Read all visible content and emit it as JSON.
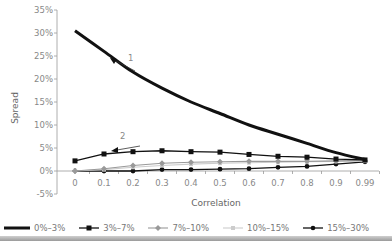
{
  "chart_data": {
    "type": "line",
    "title": "",
    "xlabel": "Correlation",
    "ylabel": "Spread",
    "x": [
      "0",
      "0.1",
      "0.2",
      "0.3",
      "0.4",
      "0.5",
      "0.6",
      "0.7",
      "0.8",
      "0.9",
      "0.99"
    ],
    "ylim": [
      -5,
      35
    ],
    "yticks": [
      "35%",
      "30%",
      "25%",
      "20%",
      "15%",
      "10%",
      "5%",
      "0%",
      "-5%"
    ],
    "grid": false,
    "legend_position": "bottom",
    "series": [
      {
        "name": "0%–3%",
        "marker": "none",
        "color": "#111111",
        "width": 3,
        "values": [
          30.5,
          26,
          21.5,
          18,
          15,
          12.5,
          10,
          8,
          6,
          4,
          2.5
        ]
      },
      {
        "name": "3%–7%",
        "marker": "square",
        "color": "#111111",
        "width": 1.3,
        "values": [
          2.2,
          3.7,
          4.2,
          4.4,
          4.2,
          4.1,
          3.6,
          3.2,
          3.0,
          2.6,
          2.4
        ]
      },
      {
        "name": "7%–10%",
        "marker": "diamond",
        "color": "#999999",
        "width": 1.1,
        "values": [
          0,
          0.5,
          1.2,
          1.7,
          1.9,
          2.0,
          2.1,
          2.1,
          2.1,
          2.2,
          2.3
        ]
      },
      {
        "name": "10%–15%",
        "marker": "square",
        "color": "#cccccc",
        "width": 1.1,
        "values": [
          0,
          0.3,
          0.8,
          1.2,
          1.5,
          1.7,
          1.8,
          1.9,
          2.0,
          2.1,
          2.2
        ]
      },
      {
        "name": "15%–30%",
        "marker": "circle",
        "color": "#111111",
        "width": 1.3,
        "values": [
          0,
          0,
          0,
          0.3,
          0.3,
          0.4,
          0.5,
          0.8,
          1.0,
          1.5,
          2.0
        ]
      }
    ],
    "annotations": [
      {
        "text": "1",
        "note": "arrow pointing up-left along 0%–3% curve"
      },
      {
        "text": "2",
        "note": "arrow pointing left above 3%–7% series"
      }
    ]
  },
  "legend": {
    "items": [
      "0%–3%",
      "3%–7%",
      "7%–10%",
      "10%–15%",
      "15%–30%"
    ]
  },
  "annotations": {
    "a1": "1",
    "a2": "2"
  },
  "axes": {
    "xlabel": "Correlation",
    "ylabel": "Spread"
  }
}
